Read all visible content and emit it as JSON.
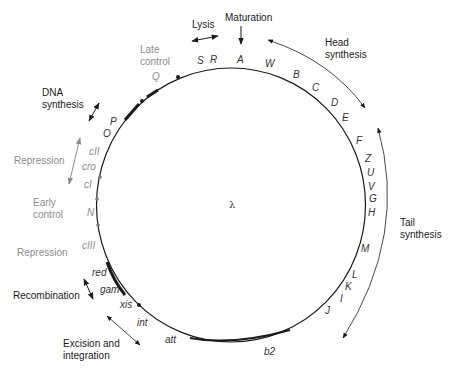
{
  "diagram": {
    "center_label": "λ",
    "colors": {
      "line": "#1a1a1a",
      "label": "#1a1a1a",
      "regulatory_label": "#8c8c8c",
      "regulatory_marker": "#7a7a7a"
    },
    "functions": {
      "lysis": "Lysis",
      "maturation": "Maturation",
      "head_synthesis": [
        "Head",
        "synthesis"
      ],
      "tail_synthesis": [
        "Tail",
        "synthesis"
      ],
      "late_control": [
        "Late",
        "control"
      ],
      "dna_synthesis": [
        "DNA",
        "synthesis"
      ],
      "repression_upper": "Repression",
      "early_control": [
        "Early",
        "control"
      ],
      "repression_lower": "Repression",
      "recombination": "Recombination",
      "excision_integration": [
        "Excision and",
        "integration"
      ]
    },
    "genes": {
      "S": "S",
      "R": "R",
      "A": "A",
      "W": "W",
      "B": "B",
      "C": "C",
      "D": "D",
      "E": "E",
      "F": "F",
      "Z": "Z",
      "U": "U",
      "V": "V",
      "G": "G",
      "H": "H",
      "M": "M",
      "L": "L",
      "K": "K",
      "I": "I",
      "J": "J",
      "b2": "b2",
      "att": "att",
      "int": "int",
      "xis": "xis",
      "gam": "gam",
      "red": "red",
      "cIII": "cIII",
      "N": "N",
      "cI": "cI",
      "cro": "cro",
      "cII": "cII",
      "O": "O",
      "P": "P",
      "Q": "Q"
    }
  }
}
